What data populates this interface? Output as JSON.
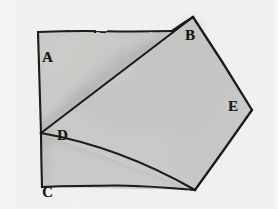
{
  "figure": {
    "medium": "pencil sketch on paper",
    "background_color": "#f7f6f4",
    "fill_color": "#c9c9c7",
    "stroke_color": "#1a1a1a",
    "shading_color": "#9a9a98",
    "labels": [
      {
        "id": "A",
        "text": "A",
        "x": 48,
        "y": 58
      },
      {
        "id": "B",
        "text": "B",
        "x": 192,
        "y": 36
      },
      {
        "id": "C",
        "text": "C",
        "x": 48,
        "y": 193
      },
      {
        "id": "D",
        "text": "D",
        "x": 63,
        "y": 136
      },
      {
        "id": "E",
        "text": "E",
        "x": 234,
        "y": 107
      }
    ],
    "geometry": {
      "outline_points": "38,32 172,31 193,17 252,110 195,190 42,187",
      "line_D_to_apex": "41,133 193,17",
      "line_D_to_bottom": "41,133 195,190",
      "left_edge": "38,32 42,187",
      "bottom_edge": "42,187 195,190",
      "vertices": {
        "top_left": [
          38,
          32
        ],
        "top_mid": [
          172,
          31
        ],
        "apex_B": [
          193,
          17
        ],
        "right_E": [
          252,
          110
        ],
        "bottom_right": [
          195,
          190
        ],
        "bottom_left_C": [
          42,
          187
        ],
        "interior_D": [
          41,
          133
        ]
      }
    }
  }
}
